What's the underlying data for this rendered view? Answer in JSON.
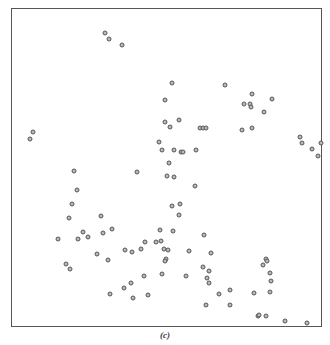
{
  "chart_data": {
    "type": "scatter",
    "title": "",
    "caption": "(c)",
    "xlabel": "",
    "ylabel": "",
    "grid": false,
    "legend": null,
    "axis_ticks": "none",
    "frame_px": {
      "left": 12,
      "top": 8,
      "right": 321,
      "bottom": 326
    },
    "point_style": {
      "marker": "small open circle",
      "color": "#555555"
    },
    "points_px": [
      [
        105,
        33
      ],
      [
        109,
        39
      ],
      [
        122,
        45
      ],
      [
        33,
        132
      ],
      [
        30,
        139
      ],
      [
        172,
        83
      ],
      [
        165,
        100
      ],
      [
        165,
        122
      ],
      [
        170,
        127
      ],
      [
        179,
        120
      ],
      [
        200,
        128
      ],
      [
        203,
        128
      ],
      [
        206,
        128
      ],
      [
        225,
        85
      ],
      [
        159,
        142
      ],
      [
        162,
        150
      ],
      [
        174,
        150
      ],
      [
        181,
        152
      ],
      [
        183,
        152
      ],
      [
        196,
        150
      ],
      [
        252,
        94
      ],
      [
        244,
        104
      ],
      [
        250,
        104
      ],
      [
        251,
        107
      ],
      [
        272,
        99
      ],
      [
        264,
        112
      ],
      [
        242,
        130
      ],
      [
        252,
        128
      ],
      [
        300,
        137
      ],
      [
        302,
        143
      ],
      [
        312,
        149
      ],
      [
        318,
        156
      ],
      [
        321,
        143
      ],
      [
        137,
        172
      ],
      [
        169,
        163
      ],
      [
        167,
        176
      ],
      [
        174,
        177
      ],
      [
        195,
        186
      ],
      [
        74,
        171
      ],
      [
        77,
        190
      ],
      [
        72,
        204
      ],
      [
        69,
        218
      ],
      [
        101,
        216
      ],
      [
        172,
        206
      ],
      [
        180,
        204
      ],
      [
        179,
        215
      ],
      [
        160,
        230
      ],
      [
        173,
        231
      ],
      [
        204,
        235
      ],
      [
        58,
        239
      ],
      [
        78,
        239
      ],
      [
        83,
        232
      ],
      [
        88,
        237
      ],
      [
        103,
        233
      ],
      [
        112,
        229
      ],
      [
        145,
        242
      ],
      [
        156,
        242
      ],
      [
        161,
        241
      ],
      [
        141,
        249
      ],
      [
        164,
        249
      ],
      [
        168,
        250
      ],
      [
        189,
        251
      ],
      [
        211,
        253
      ],
      [
        166,
        259
      ],
      [
        97,
        254
      ],
      [
        108,
        260
      ],
      [
        125,
        250
      ],
      [
        132,
        252
      ],
      [
        66,
        264
      ],
      [
        70,
        269
      ],
      [
        165,
        261
      ],
      [
        144,
        276
      ],
      [
        162,
        274
      ],
      [
        186,
        276
      ],
      [
        131,
        283
      ],
      [
        124,
        288
      ],
      [
        110,
        294
      ],
      [
        133,
        298
      ],
      [
        148,
        295
      ],
      [
        203,
        267
      ],
      [
        209,
        271
      ],
      [
        207,
        278
      ],
      [
        209,
        283
      ],
      [
        219,
        294
      ],
      [
        230,
        290
      ],
      [
        206,
        305
      ],
      [
        230,
        305
      ],
      [
        266,
        259
      ],
      [
        267,
        261
      ],
      [
        263,
        265
      ],
      [
        270,
        273
      ],
      [
        271,
        281
      ],
      [
        254,
        293
      ],
      [
        270,
        292
      ],
      [
        258,
        316
      ],
      [
        259,
        315
      ],
      [
        266,
        316
      ],
      [
        285,
        321
      ],
      [
        307,
        323
      ]
    ]
  }
}
